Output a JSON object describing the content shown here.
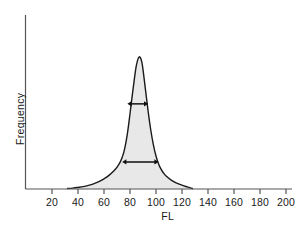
{
  "chart_data": {
    "type": "area",
    "title": "",
    "subtitle": "",
    "xlabel": "FL",
    "ylabel": "Frequency",
    "xlim": [
      0,
      206
    ],
    "ylim": [
      0,
      1.0
    ],
    "grid": false,
    "legend": null,
    "x_tick_labels": [
      "20",
      "40",
      "60",
      "80",
      "100",
      "120",
      "140",
      "160",
      "180",
      "200"
    ],
    "x_ticks": [
      20,
      40,
      60,
      80,
      100,
      120,
      140,
      160,
      180,
      200
    ],
    "y_ticks": [],
    "y_tick_labels": [],
    "series": [
      {
        "name": "Frequency distribution",
        "fill_color": "#e8e8e8",
        "line_color": "#1a1a1a",
        "x": [
          32,
          36,
          40,
          44,
          48,
          52,
          56,
          60,
          64,
          68,
          70,
          72,
          74,
          76,
          78,
          80,
          82,
          84,
          85,
          86,
          87,
          88,
          89,
          90,
          92,
          94,
          96,
          98,
          100,
          102,
          104,
          106,
          108,
          112,
          116,
          120,
          124,
          128
        ],
        "values": [
          0.004,
          0.007,
          0.012,
          0.018,
          0.027,
          0.039,
          0.055,
          0.077,
          0.105,
          0.142,
          0.165,
          0.196,
          0.24,
          0.31,
          0.42,
          0.57,
          0.73,
          0.88,
          0.94,
          0.98,
          1.0,
          0.995,
          0.965,
          0.905,
          0.745,
          0.585,
          0.445,
          0.335,
          0.25,
          0.19,
          0.148,
          0.118,
          0.096,
          0.065,
          0.044,
          0.029,
          0.016,
          0.004
        ]
      }
    ],
    "annotations": [
      {
        "name": "upper-width-arrow",
        "style": "double-headed-arrow",
        "x_start": 78,
        "x_end": 94,
        "y_level": 0.645,
        "label": ""
      },
      {
        "name": "lower-width-arrow",
        "style": "double-headed-arrow",
        "x_start": 74,
        "x_end": 102,
        "y_level": 0.205,
        "label": ""
      }
    ]
  },
  "axes": {
    "x_title": "FL",
    "y_title": "Frequency"
  }
}
